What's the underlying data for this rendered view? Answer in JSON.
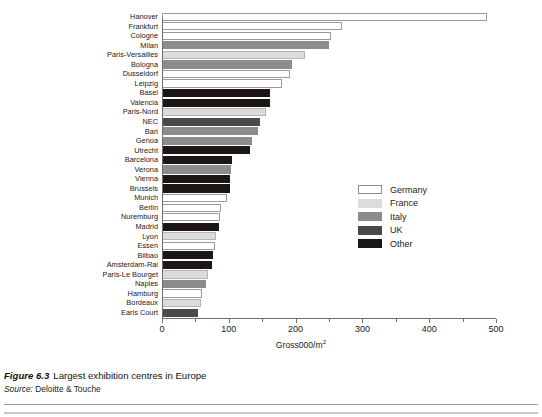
{
  "chart_data": {
    "type": "bar",
    "orientation": "horizontal",
    "title": "Largest exhibition centres in Europe",
    "xlabel": "Gross000/m²",
    "ylabel": "",
    "xlim": [
      0,
      500
    ],
    "xticks": [
      0,
      100,
      200,
      300,
      400,
      500
    ],
    "xtick_labels": [
      "0",
      "100",
      "200",
      "300",
      "400",
      "500"
    ],
    "grid": false,
    "legend_position": "center-right",
    "categories": [
      "Hanover",
      "Frankfurt",
      "Cologne",
      "Milan",
      "Paris-Versailles",
      "Bologna",
      "Dusseldorf",
      "Leipzig",
      "Basel",
      "Valencia",
      "Paris-Nord",
      "NEC",
      "Bari",
      "Genoa",
      "Utrecht",
      "Barcelona",
      "Verona",
      "Vienna",
      "Brussels",
      "Munich",
      "Berlin",
      "Nuremburg",
      "Madrid",
      "Lyon",
      "Essen",
      "Bilbao",
      "Amsterdam-Rai",
      "Paris-Le Bourget",
      "Naples",
      "Hamburg",
      "Bordeaux",
      "Earls Court"
    ],
    "values": [
      487,
      269,
      253,
      250,
      214,
      195,
      192,
      180,
      162,
      162,
      156,
      147,
      144,
      134,
      132,
      105,
      103,
      102,
      102,
      97,
      88,
      87,
      86,
      81,
      79,
      77,
      75,
      69,
      66,
      60,
      59,
      54
    ],
    "groups": [
      "Germany",
      "Germany",
      "Germany",
      "Italy",
      "France",
      "Italy",
      "Germany",
      "Germany",
      "Other",
      "Other",
      "France",
      "UK",
      "Italy",
      "Italy",
      "Other",
      "Other",
      "Italy",
      "Other",
      "Other",
      "Germany",
      "Germany",
      "Germany",
      "Other",
      "France",
      "Germany",
      "Other",
      "Other",
      "France",
      "Italy",
      "Germany",
      "France",
      "UK"
    ],
    "series": [
      {
        "name": "Germany",
        "color": "#ffffff"
      },
      {
        "name": "France",
        "color": "#dcdcdc"
      },
      {
        "name": "Italy",
        "color": "#8c8c8c"
      },
      {
        "name": "UK",
        "color": "#4a4a4a"
      },
      {
        "name": "Other",
        "color": "#1c1714"
      }
    ]
  },
  "legend": {
    "items": [
      {
        "label": "Germany",
        "color": "#ffffff"
      },
      {
        "label": "France",
        "color": "#dcdcdc"
      },
      {
        "label": "Italy",
        "color": "#8c8c8c"
      },
      {
        "label": "UK",
        "color": "#4a4a4a"
      },
      {
        "label": "Other",
        "color": "#1c1714"
      }
    ]
  },
  "axis": {
    "xlabel_text": "Gross000/m",
    "xlabel_sup": "2"
  },
  "caption": {
    "figure_number": "Figure 6.3",
    "figure_title": "Largest exhibition centres in Europe",
    "source_word": "Source:",
    "source_value": "Deloitte & Touche"
  }
}
